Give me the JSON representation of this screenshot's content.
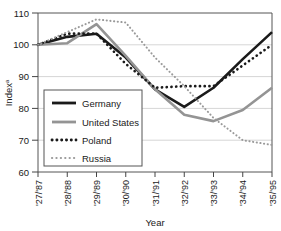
{
  "chart_data": {
    "type": "line",
    "title": "",
    "xlabel": "Year",
    "ylabel": "Index",
    "ylabel_superscript": "a",
    "categories": [
      "'27/'87",
      "'28/'88",
      "'29/'89",
      "'30/'90",
      "'31/'91",
      "'32/'92",
      "'33/'93",
      "'34/'94",
      "'35/'95"
    ],
    "ylim": [
      60,
      110
    ],
    "yticks": [
      60,
      70,
      80,
      90,
      100,
      110
    ],
    "grid": true,
    "legend_position": "inside-left",
    "series": [
      {
        "name": "Germany",
        "color": "#1a1a1a",
        "style": "solid",
        "width": 2.6,
        "values": [
          100,
          102.5,
          103.5,
          96,
          86,
          80.5,
          86.5,
          95.5,
          104
        ]
      },
      {
        "name": "United States",
        "color": "#949494",
        "style": "solid",
        "width": 2.6,
        "values": [
          100,
          100.5,
          106.5,
          96.5,
          86,
          78,
          76,
          79.5,
          86.5
        ]
      },
      {
        "name": "Poland",
        "color": "#1a1a1a",
        "style": "dotted",
        "width": 2.6,
        "values": [
          100,
          103.5,
          103.5,
          94,
          86.5,
          87,
          87,
          93.5,
          100
        ]
      },
      {
        "name": "Russia",
        "color": "#9a9a9a",
        "style": "dotted",
        "width": 2.0,
        "values": [
          100,
          104,
          108,
          107,
          96,
          87,
          77,
          70,
          68.5
        ]
      }
    ]
  },
  "legend": {
    "items": [
      {
        "label": "Germany"
      },
      {
        "label": "United States"
      },
      {
        "label": "Poland"
      },
      {
        "label": "Russia"
      }
    ]
  },
  "axes": {
    "y_ticks": [
      "110",
      "100",
      "90",
      "80",
      "70",
      "60"
    ],
    "x_ticks": [
      "'27/'87",
      "'28/'88",
      "'29/'89",
      "'30/'90",
      "'31/'91",
      "'32/'92",
      "'33/'93",
      "'34/'94",
      "'35/'95"
    ],
    "x_title": "Year",
    "y_title": "Index",
    "y_title_sup": "a"
  }
}
